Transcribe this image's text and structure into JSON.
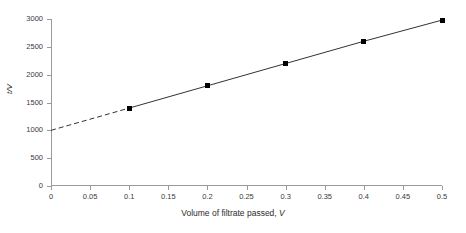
{
  "chart_data": {
    "type": "line",
    "title": "",
    "subtitle": "",
    "xlabel": "Volume of filtrate passed, V",
    "xlabel_plain": "Volume of filtrate passed,",
    "xlabel_var": "V",
    "ylabel": "t/V",
    "x": [
      0.1,
      0.2,
      0.3,
      0.4,
      0.5
    ],
    "values": [
      1400,
      1800,
      2200,
      2600,
      2980
    ],
    "series": [
      {
        "name": "t/V vs V",
        "x": [
          0.1,
          0.2,
          0.3,
          0.4,
          0.5
        ],
        "values": [
          1400,
          1800,
          2200,
          2600,
          2980
        ],
        "marker": "square",
        "marker_color": "#000000",
        "line_color": "#333333",
        "line_style": "solid"
      },
      {
        "name": "extrapolation",
        "x": [
          0.0,
          0.1
        ],
        "values": [
          1000,
          1400
        ],
        "marker": "none",
        "line_color": "#333333",
        "line_style": "dashed"
      }
    ],
    "intercept": 1000,
    "xlim": [
      0,
      0.5
    ],
    "ylim": [
      0,
      3000
    ],
    "xticks": [
      0,
      0.05,
      0.1,
      0.15,
      0.2,
      0.25,
      0.3,
      0.35,
      0.4,
      0.45,
      0.5
    ],
    "xticklabels": [
      "0",
      "0.05",
      "0.1",
      "0.15",
      "0.2",
      "0.25",
      "0.3",
      "0.35",
      "0.4",
      "0.45",
      "0.5"
    ],
    "yticks": [
      0,
      500,
      1000,
      1500,
      2000,
      2500,
      3000
    ],
    "yticklabels": [
      "0",
      "500",
      "1000",
      "1500",
      "2000",
      "2500",
      "3000"
    ],
    "grid": false,
    "legend": false,
    "legend_position": "none",
    "axis_color": "#9a9a9a",
    "text_color": "#2b2b2b",
    "background": "#ffffff"
  }
}
